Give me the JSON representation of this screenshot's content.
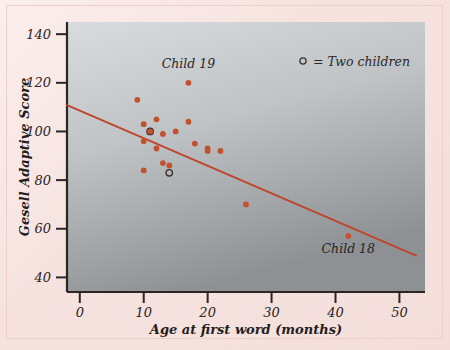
{
  "figure": {
    "name": "gesell-adaptive-score-scatterplot",
    "page_background": "#f6e3e0",
    "plot_background_top": "#d5d8da",
    "plot_background_bottom": "#8f9396",
    "point_color": "#c2512f",
    "line_color": "#c0442b",
    "axis_color": "#2b2523"
  },
  "chart_data": {
    "type": "scatter",
    "title": "",
    "xlabel": "Age at first word (months)",
    "ylabel": "Gesell Adaptive Score",
    "xlim": [
      -2,
      54
    ],
    "ylim": [
      34,
      145
    ],
    "xticks": [
      0,
      10,
      20,
      30,
      40,
      50
    ],
    "yticks": [
      40,
      60,
      80,
      100,
      120,
      140
    ],
    "grid": false,
    "x": [
      9,
      10,
      10,
      10,
      11,
      11,
      12,
      13,
      13,
      14,
      15,
      15,
      15,
      17,
      18,
      18,
      20,
      20,
      20,
      26,
      42
    ],
    "y": [
      113,
      103,
      96,
      84,
      100,
      100,
      93,
      105,
      99,
      87,
      100,
      89,
      86,
      120,
      104,
      95,
      92,
      93,
      88,
      70,
      57
    ],
    "points": [
      {
        "x": 9,
        "y": 113,
        "marker": "filled",
        "label": ""
      },
      {
        "x": 10,
        "y": 103,
        "marker": "filled",
        "label": ""
      },
      {
        "x": 10,
        "y": 96,
        "marker": "filled",
        "label": ""
      },
      {
        "x": 10,
        "y": 84,
        "marker": "filled",
        "label": ""
      },
      {
        "x": 11,
        "y": 100,
        "marker": "open",
        "label": ""
      },
      {
        "x": 11,
        "y": 100,
        "marker": "filled",
        "label": ""
      },
      {
        "x": 12,
        "y": 105,
        "marker": "filled",
        "label": ""
      },
      {
        "x": 12,
        "y": 93,
        "marker": "filled",
        "label": ""
      },
      {
        "x": 13,
        "y": 99,
        "marker": "filled",
        "label": ""
      },
      {
        "x": 13,
        "y": 87,
        "marker": "filled",
        "label": ""
      },
      {
        "x": 14,
        "y": 86,
        "marker": "filled",
        "label": ""
      },
      {
        "x": 14,
        "y": 83,
        "marker": "open",
        "label": ""
      },
      {
        "x": 15,
        "y": 100,
        "marker": "filled",
        "label": ""
      },
      {
        "x": 17,
        "y": 120,
        "marker": "filled",
        "label": "Child 19"
      },
      {
        "x": 17,
        "y": 104,
        "marker": "filled",
        "label": ""
      },
      {
        "x": 18,
        "y": 95,
        "marker": "filled",
        "label": ""
      },
      {
        "x": 20,
        "y": 93,
        "marker": "filled",
        "label": ""
      },
      {
        "x": 20,
        "y": 92,
        "marker": "filled",
        "label": ""
      },
      {
        "x": 22,
        "y": 92,
        "marker": "filled",
        "label": ""
      },
      {
        "x": 26,
        "y": 70,
        "marker": "filled",
        "label": ""
      },
      {
        "x": 42,
        "y": 57,
        "marker": "filled",
        "label": "Child 18"
      }
    ],
    "fit_line": {
      "name": "least-squares-regression-line",
      "x_start": -2,
      "y_start": 110.8,
      "x_end": 52.6,
      "y_end": 49.0,
      "color": "#c0442b"
    },
    "annotations": [
      {
        "text": "Child 19",
        "x": 17,
        "y": 126,
        "anchor": "middle"
      },
      {
        "text": "Child 18",
        "x": 42,
        "y": 50,
        "anchor": "middle"
      }
    ],
    "legend": {
      "position": "top-right",
      "entries": [
        {
          "marker": "open",
          "text": "= Two children"
        }
      ]
    }
  },
  "axis": {
    "x_tick_labels": [
      "0",
      "10",
      "20",
      "30",
      "40",
      "50"
    ],
    "y_tick_labels": [
      "40",
      "60",
      "80",
      "100",
      "120",
      "140"
    ],
    "x_title": "Age at first word (months)",
    "y_title": "Gesell Adaptive Score"
  }
}
